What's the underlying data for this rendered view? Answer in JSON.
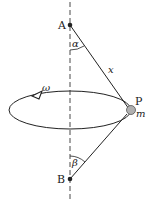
{
  "diagram": {
    "points": {
      "A": {
        "label": "A"
      },
      "B": {
        "label": "B"
      },
      "P": {
        "label": "P"
      }
    },
    "labels": {
      "alpha": "α",
      "beta": "β",
      "length": "x",
      "omega": "ω",
      "mass": "m"
    },
    "colors": {
      "line": "#222222",
      "mass_fill": "#b0b0b0",
      "background": "#ffffff"
    }
  }
}
